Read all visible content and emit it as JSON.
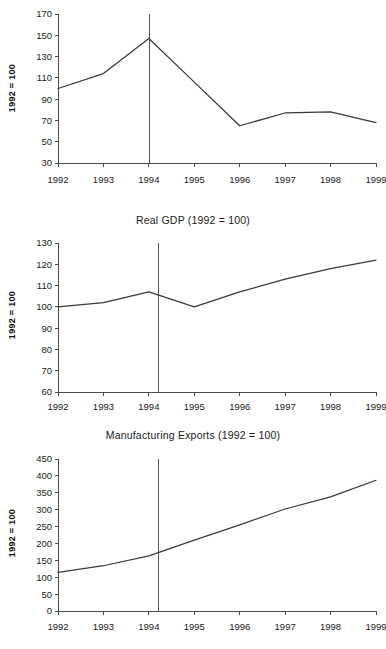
{
  "figure": {
    "width": 386,
    "height": 649,
    "background": "#ffffff",
    "line_color": "#3a3a3a",
    "axis_color": "#4a4a4a",
    "vline_color": "#555555",
    "ylabel_text": "1992 = 100"
  },
  "chart_data": [
    {
      "type": "line",
      "title": "",
      "xlabel": "",
      "ylabel": "1992 = 100",
      "categories": [
        "1992",
        "1993",
        "1994",
        "1995",
        "1996",
        "1997",
        "1998",
        "1999"
      ],
      "x": [
        1992,
        1993,
        1994,
        1995,
        1996,
        1997,
        1998,
        1999
      ],
      "values": [
        100,
        114,
        147,
        106,
        65,
        77,
        78,
        68
      ],
      "xlim": [
        1992,
        1999
      ],
      "ylim": [
        30,
        170
      ],
      "yticks": [
        30,
        50,
        70,
        90,
        110,
        130,
        150,
        170
      ],
      "xticks": [
        "1992",
        "1993",
        "1994",
        "1995",
        "1996",
        "1997",
        "1998",
        "1999"
      ],
      "grid": false,
      "legend": "none",
      "annotations": [
        {
          "type": "vertical-reference-line",
          "x": 1994,
          "label": ""
        }
      ]
    },
    {
      "type": "line",
      "title": "Real GDP (1992 = 100)",
      "xlabel": "",
      "ylabel": "1992 = 100",
      "categories": [
        "1992",
        "1993",
        "1994",
        "1995",
        "1996",
        "1997",
        "1998",
        "1999"
      ],
      "x": [
        1992,
        1993,
        1994,
        1995,
        1996,
        1997,
        1998,
        1999
      ],
      "values": [
        100,
        102,
        107,
        100,
        107,
        113,
        118,
        122
      ],
      "xlim": [
        1992,
        1999
      ],
      "ylim": [
        60,
        130
      ],
      "yticks": [
        60,
        70,
        80,
        90,
        100,
        110,
        120,
        130
      ],
      "xticks": [
        "1992",
        "1993",
        "1994",
        "1995",
        "1996",
        "1997",
        "1998",
        "1999"
      ],
      "grid": false,
      "legend": "none",
      "annotations": [
        {
          "type": "vertical-reference-line",
          "x": 1994.2,
          "label": ""
        }
      ]
    },
    {
      "type": "line",
      "title": "Manufacturing  Exports  (1992  =  100)",
      "xlabel": "",
      "ylabel": "1992 = 100",
      "categories": [
        "1992",
        "1993",
        "1994",
        "1995",
        "1996",
        "1997",
        "1998",
        "1999"
      ],
      "x": [
        1992,
        1993,
        1994,
        1995,
        1996,
        1997,
        1998,
        1999
      ],
      "values": [
        114,
        134,
        163,
        210,
        255,
        302,
        338,
        387
      ],
      "xlim": [
        1992,
        1999
      ],
      "ylim": [
        0,
        450
      ],
      "yticks": [
        0,
        50,
        100,
        150,
        200,
        250,
        300,
        350,
        400,
        450
      ],
      "xticks": [
        "1992",
        "1993",
        "1994",
        "1995",
        "1996",
        "1997",
        "1998",
        "1999"
      ],
      "grid": false,
      "legend": "none",
      "annotations": [
        {
          "type": "vertical-reference-line",
          "x": 1994.2,
          "label": ""
        }
      ]
    }
  ]
}
